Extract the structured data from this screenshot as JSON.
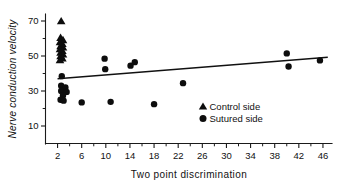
{
  "chart_data": {
    "type": "scatter",
    "title": "",
    "xlabel": "Two point discrimination",
    "ylabel": "Nerve conduction velocity",
    "xlim": [
      0,
      47.5
    ],
    "ylim": [
      0,
      74
    ],
    "grid": false,
    "xticks": [
      2,
      6,
      10,
      14,
      18,
      22,
      26,
      30,
      34,
      38,
      42,
      46
    ],
    "xtick_labels": [
      "2",
      "6",
      "10",
      "14",
      "18",
      "22",
      "26",
      "30",
      "34",
      "38",
      "42",
      "46"
    ],
    "x_minor_ticks": [
      4,
      8,
      12,
      16,
      20,
      24,
      28,
      32,
      36,
      40,
      44
    ],
    "yticks": [
      10,
      30,
      50,
      70
    ],
    "ytick_labels": [
      "10",
      "30",
      "50",
      "70"
    ],
    "y_minor_ticks": [
      20,
      40,
      60
    ],
    "legend_position": "center-right",
    "legend": [
      {
        "marker": "triangle",
        "label": "Control side"
      },
      {
        "marker": "circle",
        "label": "Sutured side"
      }
    ],
    "series": [
      {
        "name": "Control side",
        "marker": "triangle",
        "points": [
          {
            "x": 2.6,
            "y": 70.0
          },
          {
            "x": 2.5,
            "y": 60.5
          },
          {
            "x": 2.9,
            "y": 59.2
          },
          {
            "x": 2.4,
            "y": 58.0
          },
          {
            "x": 2.8,
            "y": 57.0
          },
          {
            "x": 2.5,
            "y": 55.8
          },
          {
            "x": 2.9,
            "y": 55.0
          },
          {
            "x": 2.4,
            "y": 54.0
          },
          {
            "x": 2.8,
            "y": 53.0
          },
          {
            "x": 2.5,
            "y": 52.0
          },
          {
            "x": 2.9,
            "y": 51.0
          },
          {
            "x": 2.5,
            "y": 50.0
          },
          {
            "x": 2.8,
            "y": 48.8
          },
          {
            "x": 2.4,
            "y": 47.8
          }
        ]
      },
      {
        "name": "Sutured side",
        "marker": "circle",
        "points": [
          {
            "x": 2.7,
            "y": 38.5
          },
          {
            "x": 2.6,
            "y": 33.0
          },
          {
            "x": 3.3,
            "y": 32.0
          },
          {
            "x": 2.6,
            "y": 30.0
          },
          {
            "x": 3.5,
            "y": 29.5
          },
          {
            "x": 2.9,
            "y": 27.5
          },
          {
            "x": 2.5,
            "y": 25.0
          },
          {
            "x": 3.0,
            "y": 24.5
          },
          {
            "x": 6.0,
            "y": 23.5
          },
          {
            "x": 9.8,
            "y": 48.5
          },
          {
            "x": 9.9,
            "y": 42.5
          },
          {
            "x": 10.8,
            "y": 23.8
          },
          {
            "x": 14.1,
            "y": 44.5
          },
          {
            "x": 14.8,
            "y": 46.5
          },
          {
            "x": 18.0,
            "y": 22.5
          },
          {
            "x": 22.8,
            "y": 34.5
          },
          {
            "x": 40.0,
            "y": 51.5
          },
          {
            "x": 40.3,
            "y": 44.0
          },
          {
            "x": 45.5,
            "y": 47.5
          }
        ]
      }
    ],
    "fit_line": {
      "name": "regression line",
      "x_start": 2.0,
      "y_start": 37.0,
      "x_end": 46.8,
      "y_end": 49.3
    }
  }
}
